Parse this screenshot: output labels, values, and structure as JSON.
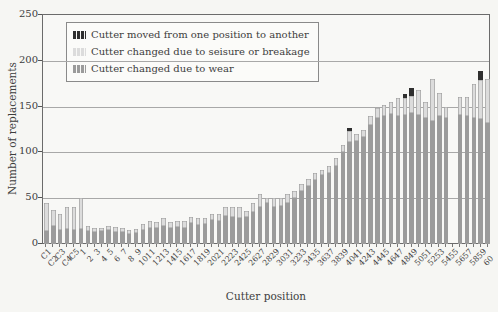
{
  "chart_data": {
    "type": "bar",
    "stacked": true,
    "xlabel": "Cutter position",
    "ylabel": "Number of replacements",
    "ylim": [
      0,
      250
    ],
    "yticks": [
      0,
      50,
      100,
      150,
      200,
      250
    ],
    "grid": true,
    "legend_position": "top-left-inside",
    "categories": [
      "C1",
      "C2",
      "C3",
      "C4",
      "C5",
      "1",
      "2",
      "3",
      "4",
      "5",
      "6",
      "7",
      "8",
      "9",
      "10",
      "11",
      "12",
      "13",
      "14",
      "15",
      "16",
      "17",
      "18",
      "19",
      "20",
      "21",
      "22",
      "23",
      "24",
      "25",
      "26",
      "27",
      "28",
      "29",
      "30",
      "31",
      "32",
      "33",
      "34",
      "35",
      "36",
      "37",
      "38",
      "39",
      "40",
      "41",
      "42",
      "43",
      "44",
      "45",
      "46",
      "47",
      "48",
      "49",
      "50",
      "51",
      "52",
      "53",
      "54",
      "55",
      "56",
      "57",
      "58",
      "59",
      "60"
    ],
    "series": [
      {
        "name": "Cutter changed due to wear",
        "color": "#9b9b9b",
        "values": [
          14,
          20,
          15,
          16,
          15,
          16,
          14,
          13,
          14,
          15,
          13,
          13,
          11,
          12,
          15,
          18,
          17,
          20,
          18,
          19,
          18,
          23,
          21,
          22,
          26,
          25,
          31,
          30,
          28,
          30,
          35,
          40,
          45,
          40,
          42,
          45,
          50,
          58,
          63,
          70,
          75,
          78,
          85,
          100,
          111,
          112,
          117,
          130,
          138,
          140,
          142,
          140,
          141,
          143,
          141,
          138,
          134,
          140,
          138,
          0,
          141,
          140,
          138,
          136,
          132
        ]
      },
      {
        "name": "Cutter changed due to seisure or breakage",
        "color": "#dcdcdc",
        "values": [
          31,
          17,
          18,
          24,
          25,
          34,
          6,
          5,
          4,
          5,
          6,
          5,
          4,
          4,
          7,
          7,
          7,
          8,
          6,
          6,
          7,
          6,
          7,
          6,
          7,
          8,
          9,
          10,
          12,
          6,
          10,
          15,
          5,
          10,
          8,
          10,
          8,
          7,
          8,
          8,
          6,
          7,
          9,
          8,
          12,
          8,
          7,
          10,
          10,
          12,
          13,
          19,
          18,
          19,
          27,
          17,
          46,
          25,
          12,
          0,
          20,
          21,
          37,
          43,
          48
        ]
      },
      {
        "name": "Cutter moved from one position to another",
        "color": "#2f2f2f",
        "values": [
          0,
          0,
          0,
          0,
          0,
          0,
          0,
          0,
          0,
          0,
          0,
          0,
          0,
          0,
          0,
          0,
          0,
          0,
          0,
          0,
          0,
          0,
          0,
          0,
          0,
          0,
          0,
          0,
          0,
          0,
          0,
          0,
          0,
          0,
          0,
          0,
          0,
          0,
          0,
          0,
          0,
          0,
          0,
          0,
          4,
          0,
          0,
          0,
          0,
          0,
          0,
          0,
          5,
          8,
          0,
          0,
          0,
          0,
          0,
          0,
          0,
          0,
          0,
          10,
          0
        ]
      }
    ],
    "legend": {
      "entries": [
        {
          "label": "Cutter moved from one position to another",
          "color": "#2f2f2f"
        },
        {
          "label": "Cutter changed due to seisure or breakage",
          "color": "#dcdcdc"
        },
        {
          "label": "Cutter changed due to wear",
          "color": "#9b9b9b"
        }
      ]
    }
  }
}
